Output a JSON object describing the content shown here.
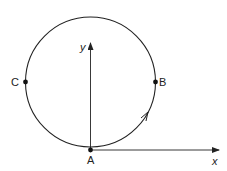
{
  "diagram": {
    "axes": {
      "x_label": "x",
      "y_label": "y"
    },
    "points": [
      {
        "label": "A",
        "position": "bottom of circle, origin"
      },
      {
        "label": "B",
        "position": "right end of horizontal diameter"
      },
      {
        "label": "C",
        "position": "left end of horizontal diameter"
      }
    ],
    "motion_arrow": "along arc from A toward B",
    "colors": {
      "stroke": "#222222",
      "background": "#ffffff"
    }
  }
}
